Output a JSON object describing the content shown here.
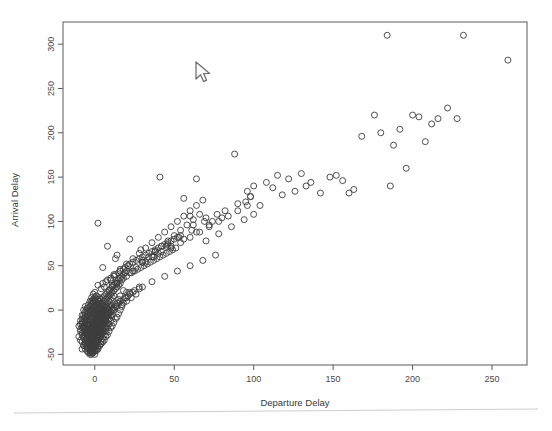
{
  "window": {
    "background_color": "#ffffff",
    "footer_rule_color": "#cfcfcf"
  },
  "cursor": {
    "name": "mouse-pointer",
    "x": 198,
    "y": 64,
    "color": "#6e6e6e"
  },
  "chart_data": {
    "type": "scatter",
    "title": "",
    "xlabel": "Departure Delay",
    "ylabel": "Arrival Delay",
    "xlim": [
      -20,
      272
    ],
    "ylim": [
      -62,
      325
    ],
    "xticks": [
      0,
      50,
      100,
      150,
      200,
      250
    ],
    "yticks": [
      -50,
      0,
      50,
      100,
      150,
      200,
      250,
      300
    ],
    "xticklabels": [
      "0",
      "50",
      "100",
      "150",
      "200",
      "250"
    ],
    "yticklabels": [
      "-50",
      "0",
      "50",
      "100",
      "150",
      "200",
      "250",
      "300"
    ],
    "grid": false,
    "legend": null,
    "marker": "open-circle",
    "marker_size": 6,
    "marker_color": "#3d3d3d",
    "n_points": 712,
    "series": [
      {
        "name": "flights",
        "x": [
          -8,
          -7,
          -6,
          -6,
          -5,
          -5,
          -5,
          -4,
          -4,
          -4,
          -4,
          -3,
          -3,
          -3,
          -3,
          -3,
          -2,
          -2,
          -2,
          -2,
          -2,
          -2,
          -1,
          -1,
          -1,
          -1,
          -1,
          -1,
          -1,
          0,
          0,
          0,
          0,
          0,
          0,
          0,
          0,
          1,
          1,
          1,
          1,
          1,
          1,
          1,
          1,
          2,
          2,
          2,
          2,
          2,
          2,
          2,
          2,
          3,
          3,
          3,
          3,
          3,
          3,
          3,
          4,
          4,
          4,
          4,
          4,
          4,
          4,
          5,
          5,
          5,
          5,
          5,
          5,
          6,
          6,
          6,
          6,
          6,
          6,
          7,
          7,
          7,
          7,
          7,
          8,
          8,
          8,
          8,
          8,
          9,
          9,
          9,
          9,
          10,
          10,
          10,
          10,
          11,
          11,
          11,
          12,
          12,
          12,
          13,
          13,
          14,
          14,
          15,
          15,
          16,
          16,
          17,
          18,
          19,
          20,
          -9,
          -8,
          -8,
          -7,
          -7,
          -7,
          -6,
          -6,
          -6,
          -6,
          -5,
          -5,
          -5,
          -5,
          -4,
          -4,
          -4,
          -4,
          -4,
          -3,
          -3,
          -3,
          -3,
          -3,
          -3,
          -2,
          -2,
          -2,
          -2,
          -2,
          -2,
          -2,
          -1,
          -1,
          -1,
          -1,
          -1,
          -1,
          -1,
          -1,
          0,
          0,
          0,
          0,
          0,
          0,
          0,
          0,
          0,
          1,
          1,
          1,
          1,
          1,
          1,
          1,
          1,
          2,
          2,
          2,
          2,
          2,
          2,
          2,
          3,
          3,
          3,
          3,
          3,
          3,
          4,
          4,
          4,
          4,
          4,
          5,
          5,
          5,
          5,
          6,
          6,
          6,
          6,
          7,
          7,
          7,
          8,
          8,
          8,
          9,
          9,
          10,
          10,
          11,
          11,
          12,
          13,
          14,
          15,
          16,
          17,
          18,
          20,
          22,
          -10,
          -9,
          -9,
          -8,
          -8,
          -8,
          -7,
          -7,
          -7,
          -7,
          -6,
          -6,
          -6,
          -6,
          -6,
          -5,
          -5,
          -5,
          -5,
          -5,
          -4,
          -4,
          -4,
          -4,
          -4,
          -4,
          -3,
          -3,
          -3,
          -3,
          -3,
          -3,
          -3,
          -2,
          -2,
          -2,
          -2,
          -2,
          -2,
          -2,
          -2,
          -1,
          -1,
          -1,
          -1,
          -1,
          -1,
          -1,
          -1,
          0,
          0,
          0,
          0,
          0,
          0,
          0,
          0,
          1,
          1,
          1,
          1,
          1,
          1,
          1,
          2,
          2,
          2,
          2,
          2,
          2,
          3,
          3,
          3,
          3,
          3,
          4,
          4,
          4,
          4,
          5,
          5,
          5,
          5,
          6,
          6,
          6,
          7,
          7,
          8,
          8,
          9,
          9,
          10,
          11,
          12,
          13,
          14,
          15,
          16,
          18,
          -8,
          -7,
          -6,
          -5,
          -5,
          -4,
          -4,
          -3,
          -3,
          -2,
          -2,
          -1,
          -1,
          0,
          0,
          0,
          1,
          1,
          2,
          2,
          3,
          3,
          4,
          4,
          5,
          5,
          6,
          6,
          7,
          8,
          8,
          9,
          10,
          10,
          11,
          12,
          13,
          14,
          15,
          16,
          17,
          18,
          19,
          20,
          21,
          22,
          23,
          24,
          25,
          26,
          28,
          30,
          2,
          4,
          5,
          6,
          7,
          8,
          9,
          10,
          11,
          12,
          13,
          14,
          15,
          16,
          17,
          18,
          19,
          20,
          21,
          22,
          23,
          24,
          25,
          26,
          27,
          28,
          29,
          30,
          31,
          32,
          33,
          34,
          35,
          36,
          37,
          38,
          39,
          40,
          41,
          42,
          43,
          44,
          45,
          46,
          47,
          48,
          49,
          50,
          51,
          52,
          10,
          12,
          14,
          16,
          18,
          20,
          22,
          24,
          26,
          28,
          30,
          32,
          34,
          36,
          38,
          40,
          42,
          44,
          46,
          48,
          50,
          52,
          54,
          56,
          58,
          60,
          62,
          64,
          66,
          68,
          20,
          24,
          28,
          32,
          36,
          40,
          44,
          48,
          52,
          56,
          60,
          64,
          68,
          72,
          76,
          80,
          30,
          36,
          42,
          48,
          54,
          60,
          66,
          72,
          78,
          84,
          90,
          96,
          41,
          56,
          60,
          64,
          70,
          74,
          78,
          82,
          86,
          90,
          94,
          98,
          100,
          88,
          95,
          96,
          98,
          100,
          104,
          108,
          112,
          115,
          118,
          122,
          126,
          130,
          133,
          136,
          142,
          148,
          152,
          156,
          160,
          163,
          168,
          176,
          180,
          184,
          186,
          188,
          192,
          196,
          200,
          204,
          208,
          212,
          216,
          222,
          228,
          232,
          260,
          -10,
          -9,
          -8,
          -7,
          -6,
          -5,
          -4,
          -3,
          -2,
          -1,
          0,
          1,
          2,
          3,
          4,
          5,
          6,
          7,
          8,
          9,
          10,
          -9,
          -8,
          -7,
          -6,
          -5,
          -4,
          -3,
          -2,
          -1,
          0,
          1,
          2,
          3,
          4,
          5,
          6,
          7,
          8,
          -7,
          -6,
          -5,
          -4,
          -3,
          -2,
          -1,
          0,
          1,
          2,
          3,
          4,
          5,
          6,
          -5,
          -4,
          -3,
          -2,
          -1,
          0,
          1,
          2,
          3,
          4,
          2,
          8,
          14,
          22,
          30,
          38,
          46,
          54,
          62,
          70,
          5,
          13,
          21,
          29,
          37,
          45,
          53,
          61,
          69,
          77
        ],
        "y": [
          -14,
          -18,
          -12,
          -22,
          -8,
          -16,
          -26,
          -4,
          -12,
          -20,
          -30,
          -2,
          -10,
          -18,
          -24,
          -32,
          0,
          -6,
          -14,
          -22,
          -28,
          -34,
          2,
          -4,
          -10,
          -16,
          -24,
          -30,
          -36,
          4,
          -2,
          -8,
          -14,
          -20,
          -26,
          -32,
          -38,
          6,
          0,
          -6,
          -12,
          -18,
          -24,
          -30,
          -40,
          8,
          2,
          -4,
          -10,
          -16,
          -22,
          -28,
          -34,
          10,
          4,
          -2,
          -8,
          -14,
          -20,
          -26,
          12,
          6,
          0,
          -6,
          -12,
          -18,
          -24,
          14,
          8,
          2,
          -4,
          -10,
          -16,
          16,
          10,
          4,
          -2,
          -8,
          -14,
          18,
          12,
          6,
          0,
          -6,
          20,
          14,
          8,
          2,
          -4,
          22,
          16,
          10,
          4,
          24,
          18,
          12,
          6,
          26,
          20,
          14,
          28,
          22,
          16,
          30,
          24,
          32,
          26,
          34,
          28,
          36,
          30,
          38,
          40,
          42,
          44,
          -16,
          -20,
          -10,
          -24,
          -14,
          -6,
          -28,
          -18,
          -8,
          -2,
          -32,
          -22,
          -12,
          0,
          -36,
          -26,
          -16,
          -6,
          2,
          -40,
          -30,
          -20,
          -10,
          0,
          4,
          -44,
          -34,
          -24,
          -14,
          -4,
          6,
          10,
          -48,
          -38,
          -28,
          -18,
          -8,
          2,
          8,
          12,
          -50,
          -42,
          -32,
          -22,
          -12,
          -2,
          4,
          10,
          14,
          -46,
          -36,
          -26,
          -16,
          -6,
          0,
          8,
          16,
          -44,
          -34,
          -24,
          -14,
          -4,
          2,
          12,
          -40,
          -30,
          -20,
          -10,
          0,
          14,
          -38,
          -28,
          -18,
          -8,
          6,
          -36,
          -26,
          -16,
          -4,
          -34,
          -24,
          -12,
          4,
          -30,
          -20,
          -8,
          -28,
          -16,
          -2,
          -24,
          -10,
          -20,
          -6,
          -18,
          2,
          -14,
          -10,
          -8,
          -4,
          0,
          4,
          8,
          14,
          20,
          -18,
          -22,
          -12,
          -26,
          -16,
          -6,
          -30,
          -20,
          -10,
          0,
          -34,
          -24,
          -14,
          -4,
          4,
          -38,
          -28,
          -18,
          -8,
          2,
          -42,
          -32,
          -22,
          -12,
          -2,
          6,
          -46,
          -36,
          -26,
          -16,
          -6,
          4,
          10,
          -50,
          -40,
          -30,
          -20,
          -10,
          0,
          8,
          14,
          -48,
          -38,
          -28,
          -18,
          -8,
          2,
          10,
          18,
          -46,
          -36,
          -26,
          -16,
          -6,
          4,
          12,
          20,
          -44,
          -34,
          -24,
          -14,
          -4,
          6,
          16,
          -42,
          -32,
          -22,
          -12,
          -2,
          10,
          -40,
          -30,
          -20,
          -8,
          6,
          -36,
          -26,
          -14,
          2,
          -32,
          -22,
          -10,
          4,
          -28,
          -16,
          0,
          -24,
          -12,
          -20,
          -6,
          -16,
          0,
          -12,
          -6,
          0,
          4,
          8,
          12,
          16,
          22,
          -44,
          -40,
          -38,
          -42,
          -34,
          -36,
          -28,
          -32,
          -24,
          -30,
          -20,
          -26,
          -18,
          -22,
          -16,
          -12,
          -20,
          -10,
          -18,
          -8,
          -16,
          -6,
          -14,
          -4,
          -12,
          -2,
          -10,
          0,
          -8,
          -6,
          2,
          -4,
          -2,
          4,
          0,
          2,
          6,
          4,
          8,
          10,
          6,
          12,
          14,
          10,
          16,
          18,
          14,
          20,
          22,
          18,
          24,
          26,
          28,
          24,
          30,
          26,
          32,
          34,
          22,
          36,
          28,
          38,
          40,
          30,
          42,
          44,
          34,
          46,
          48,
          38,
          50,
          52,
          42,
          54,
          44,
          56,
          46,
          58,
          48,
          60,
          50,
          62,
          52,
          64,
          54,
          66,
          56,
          68,
          58,
          70,
          60,
          72,
          62,
          74,
          64,
          76,
          66,
          78,
          68,
          80,
          70,
          82,
          34,
          40,
          30,
          46,
          36,
          52,
          42,
          58,
          48,
          64,
          54,
          70,
          60,
          76,
          66,
          82,
          72,
          88,
          78,
          94,
          84,
          100,
          90,
          106,
          96,
          112,
          102,
          118,
          108,
          124,
          20,
          44,
          26,
          54,
          32,
          64,
          38,
          72,
          44,
          80,
          50,
          88,
          56,
          96,
          62,
          104,
          54,
          60,
          66,
          70,
          76,
          82,
          88,
          94,
          100,
          106,
          112,
          118,
          150,
          126,
          106,
          148,
          78,
          100,
          86,
          112,
          94,
          120,
          102,
          128,
          108,
          176,
          122,
          134,
          128,
          140,
          118,
          144,
          138,
          152,
          130,
          148,
          134,
          154,
          140,
          144,
          132,
          150,
          152,
          146,
          132,
          136,
          196,
          220,
          200,
          310,
          140,
          186,
          204,
          160,
          220,
          218,
          190,
          210,
          216,
          228,
          216,
          310,
          282,
          -30,
          -34,
          -36,
          -40,
          -44,
          -46,
          -48,
          -50,
          -46,
          -44,
          -42,
          -38,
          -34,
          -30,
          -26,
          -22,
          -18,
          -14,
          -10,
          -6,
          -2,
          -24,
          -28,
          -32,
          -36,
          -40,
          -44,
          -48,
          -46,
          -42,
          -38,
          -34,
          -30,
          -26,
          -22,
          -18,
          -14,
          -10,
          -6,
          -20,
          -26,
          -32,
          -38,
          -44,
          -48,
          -44,
          -40,
          -36,
          -30,
          -24,
          -18,
          -12,
          -6,
          -16,
          -24,
          -32,
          -40,
          -46,
          -42,
          -36,
          -28,
          -20,
          -12,
          98,
          72,
          62,
          80,
          56,
          66,
          74,
          84,
          96,
          104,
          48,
          58,
          50,
          68,
          60,
          72,
          82,
          90,
          100,
          108
        ]
      }
    ]
  },
  "axis": {
    "frame_color": "#5a5a5a",
    "tick_color": "#5a5a5a",
    "label_color": "#4a4a4a"
  }
}
